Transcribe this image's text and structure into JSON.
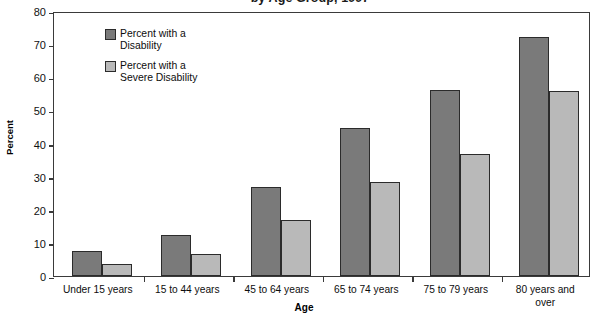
{
  "chart_data": {
    "type": "bar",
    "title": "by Age Group, 1997",
    "xlabel": "Age",
    "ylabel": "Percent",
    "ylim": [
      0,
      80
    ],
    "ytick_step": 10,
    "yticks": [
      "80",
      "70",
      "60",
      "50",
      "40",
      "30",
      "20",
      "10",
      "0"
    ],
    "grid": false,
    "legend_position": "upper-left-inside",
    "categories": [
      "Under 15 years",
      "15 to 44 years",
      "45 to 64 years",
      "65 to 74 years",
      "75 to 79 years",
      "80 years and\nover"
    ],
    "series": [
      {
        "name": "Percent with a\nDisability",
        "color": "#7a7a7a",
        "values": [
          7.6,
          12.3,
          27.0,
          44.8,
          56.3,
          72.1
        ]
      },
      {
        "name": "Percent with a\nSevere Disability",
        "color": "#b9b9b9",
        "values": [
          3.6,
          6.7,
          17.0,
          28.5,
          36.7,
          56.0
        ]
      }
    ]
  },
  "axes": {
    "frame_color": "#3a3a3a",
    "bar_outline_color": "#2b2b2b"
  }
}
